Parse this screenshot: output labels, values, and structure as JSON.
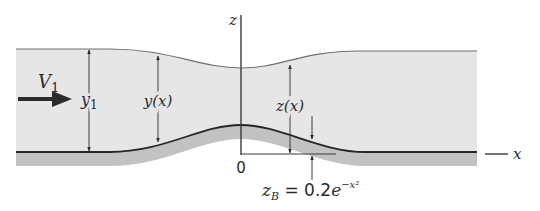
{
  "diagram": {
    "labels": {
      "velocity": "V",
      "velocity_sub": "1",
      "upstream_depth": "y",
      "upstream_depth_sub": "1",
      "local_depth": "y(x)",
      "surface_elevation": "z(x)",
      "z_axis": "z",
      "x_axis": "x",
      "origin": "0",
      "bed_equation_lhs": "z",
      "bed_equation_lhs_sub": "B",
      "bed_equation_eq": " = 0.2",
      "bed_equation_base": "e",
      "bed_equation_exp": "−x²"
    },
    "colors": {
      "water_fill": "#e6e6e6",
      "bed_fill": "#c2c2c2",
      "bed_line": "#262626",
      "surface_line": "#6e6e6e",
      "axis_line": "#3a3a3a",
      "text": "#2a2a2a",
      "arrow": "#2b2b2b"
    }
  }
}
